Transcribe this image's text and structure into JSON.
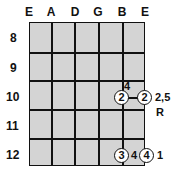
{
  "columns": [
    "E",
    "A",
    "D",
    "G",
    "B",
    "E"
  ],
  "rows": [
    "8",
    "9",
    "10",
    "11",
    "12"
  ],
  "markers": [
    {
      "value": "2",
      "row": "10",
      "col": "B"
    },
    {
      "value": "2",
      "row": "10",
      "col": "E"
    },
    {
      "value": "3",
      "row": "12",
      "col": "B"
    },
    {
      "value": "4",
      "row": "12",
      "col": "E"
    }
  ],
  "labels": {
    "above_link": "4",
    "right_of_row10": "2,5",
    "below_row10": "R",
    "between_row12": "4",
    "right_of_row12": "1"
  }
}
